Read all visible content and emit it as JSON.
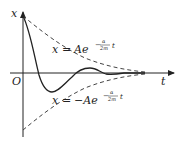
{
  "diagram": {
    "axes": {
      "y_label": "x",
      "x_label": "t",
      "origin_label": "O"
    },
    "upper_envelope": {
      "lhs": "x",
      "eq": "=",
      "coef": "Ae",
      "exp_sign": "−",
      "exp_num": "α",
      "exp_den": "2m",
      "exp_var": "t"
    },
    "lower_envelope": {
      "lhs": "x",
      "eq": "=",
      "coef": "−Ae",
      "exp_sign": "−",
      "exp_num": "α",
      "exp_den": "2m",
      "exp_var": "t"
    },
    "colors": {
      "axis": "#222222",
      "curve": "#222222",
      "envelope": "#444444"
    }
  }
}
